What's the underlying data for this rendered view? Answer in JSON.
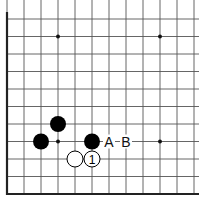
{
  "diagram": {
    "type": "go-board-fragment",
    "grid": {
      "columns": 12,
      "rows": 11,
      "origin_x": 7,
      "origin_y": 19,
      "spacing_x": 17,
      "spacing_y": 17.5,
      "edges": [
        "left",
        "bottom"
      ],
      "line_color": "#555555",
      "edge_color": "#222222"
    },
    "star_points": [
      {
        "col": 3,
        "row": 1
      },
      {
        "col": 9,
        "row": 1
      },
      {
        "col": 3,
        "row": 7
      },
      {
        "col": 9,
        "row": 7
      }
    ],
    "stones": [
      {
        "color": "black",
        "col": 2,
        "row": 7,
        "label": ""
      },
      {
        "color": "black",
        "col": 3,
        "row": 6,
        "label": ""
      },
      {
        "color": "black",
        "col": 5,
        "row": 7,
        "label": ""
      },
      {
        "color": "white",
        "col": 4,
        "row": 8,
        "label": ""
      },
      {
        "color": "white",
        "col": 5,
        "row": 8,
        "label": "1"
      }
    ],
    "labels": [
      {
        "text": "A",
        "col": 6,
        "row": 7
      },
      {
        "text": "B",
        "col": 7,
        "row": 7
      }
    ]
  }
}
